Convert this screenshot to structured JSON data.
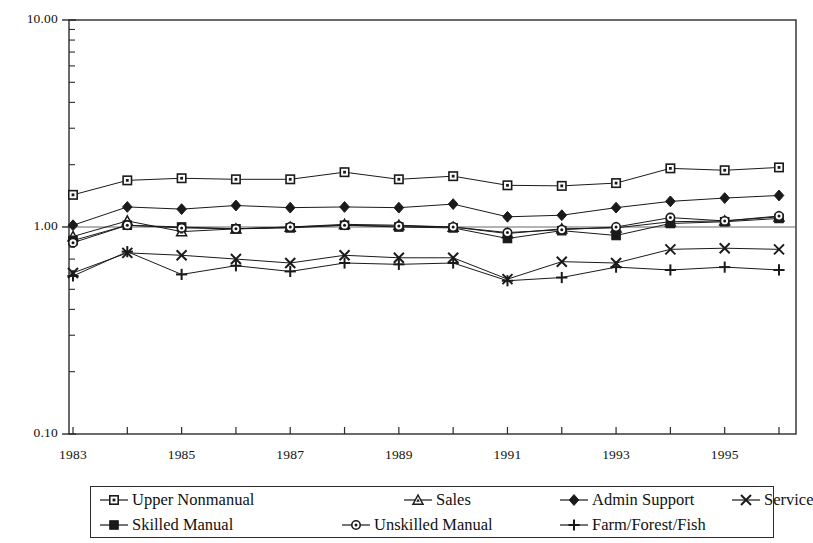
{
  "chart_data": {
    "type": "line",
    "title": "",
    "subtitle": "",
    "xlabel": "",
    "ylabel": "",
    "yscale": "log",
    "ylim": [
      0.1,
      10.0
    ],
    "ytick_labels": [
      "10.00",
      "1.00",
      "0.10"
    ],
    "ytick_values": [
      10.0,
      1.0,
      0.1
    ],
    "grid": false,
    "legend_position": "bottom",
    "x": [
      1983,
      1984,
      1985,
      1986,
      1987,
      1988,
      1989,
      1990,
      1991,
      1992,
      1993,
      1994,
      1995,
      1996
    ],
    "xtick_labels": [
      "1983",
      "1985",
      "1987",
      "1989",
      "1991",
      "1993",
      "1995"
    ],
    "xtick_values": [
      1983,
      1985,
      1987,
      1989,
      1991,
      1993,
      1995
    ],
    "series": [
      {
        "name": "Upper Nonmanual",
        "marker": "open-square",
        "values": [
          1.43,
          1.68,
          1.72,
          1.7,
          1.7,
          1.84,
          1.7,
          1.76,
          1.59,
          1.58,
          1.63,
          1.92,
          1.88,
          1.94
        ]
      },
      {
        "name": "Sales",
        "marker": "open-triangle",
        "values": [
          0.9,
          1.07,
          0.95,
          0.98,
          1.0,
          1.03,
          1.02,
          1.0,
          0.93,
          0.98,
          0.99,
          1.06,
          1.07,
          1.12
        ]
      },
      {
        "name": "Admin Support",
        "marker": "filled-diamond",
        "values": [
          1.02,
          1.25,
          1.22,
          1.27,
          1.24,
          1.25,
          1.24,
          1.29,
          1.12,
          1.14,
          1.24,
          1.33,
          1.38,
          1.42
        ]
      },
      {
        "name": "Service",
        "marker": "x-cross",
        "values": [
          0.6,
          0.75,
          0.73,
          0.7,
          0.67,
          0.73,
          0.71,
          0.71,
          0.56,
          0.68,
          0.67,
          0.78,
          0.79,
          0.78
        ]
      },
      {
        "name": "Skilled Manual",
        "marker": "filled-square",
        "values": [
          0.86,
          1.02,
          1.0,
          0.98,
          0.99,
          1.02,
          1.0,
          0.99,
          0.88,
          0.96,
          0.91,
          1.04,
          1.06,
          1.1
        ]
      },
      {
        "name": "Unskilled Manual",
        "marker": "open-circle",
        "values": [
          0.84,
          1.02,
          0.99,
          0.98,
          1.0,
          1.02,
          1.01,
          1.0,
          0.94,
          0.97,
          1.0,
          1.11,
          1.07,
          1.13
        ]
      },
      {
        "name": "Farm/Forest/Fish",
        "marker": "plus",
        "values": [
          0.58,
          0.76,
          0.59,
          0.65,
          0.61,
          0.67,
          0.66,
          0.67,
          0.55,
          0.57,
          0.64,
          0.62,
          0.64,
          0.62
        ]
      }
    ]
  },
  "axes": {
    "y_top_label": "10.00",
    "y_mid_label": "1.00",
    "y_bottom_label": "0.10"
  },
  "legend": {
    "row1": [
      {
        "label": "Upper Nonmanual",
        "marker": "open-square"
      },
      {
        "label": "Sales",
        "marker": "open-triangle"
      },
      {
        "label": "Admin Support",
        "marker": "filled-diamond"
      },
      {
        "label": "Service",
        "marker": "x-cross"
      }
    ],
    "row2": [
      {
        "label": "Skilled Manual",
        "marker": "filled-square"
      },
      {
        "label": "Unskilled Manual",
        "marker": "open-circle"
      },
      {
        "label": "Farm/Forest/Fish",
        "marker": "plus"
      }
    ]
  },
  "colors": {
    "ink": "#1a1a1a",
    "axis": "#2b2b2b",
    "background": "#ffffff"
  }
}
